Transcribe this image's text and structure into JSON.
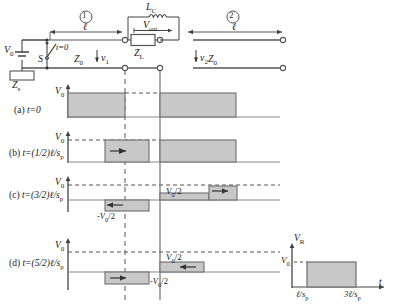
{
  "figure": {
    "type": "transmission-line-bounce-diagram",
    "circuit": {
      "source_label": "V",
      "source_sub": "0",
      "switch_label": "S",
      "switch_time_label": "t=0",
      "source_impedance": "Z",
      "source_impedance_sub": "s",
      "line1_marker": "①",
      "line2_marker": "②",
      "length_label_1": "ℓ",
      "length_label_2": "ℓ",
      "z0_left": "Z",
      "z0_left_sub": "0",
      "z0_right": "Z",
      "z0_right_sub": "0",
      "v1_label": "v",
      "v1_sub": "1",
      "v2_label": "v",
      "v2_sub": "2",
      "load_label": "Z",
      "load_sub": "L",
      "inductor_label": "L",
      "inductor_sub": "C",
      "vout_label": "V",
      "vout_sub": "out"
    },
    "panels": [
      {
        "id": "a",
        "label_prefix": "(a)",
        "time_label": "t=0",
        "y_axis_label": "V",
        "y_axis_sub": "0",
        "inline_labels": []
      },
      {
        "id": "b",
        "label_prefix": "(b)",
        "time_label": "t=(1/2)ℓ/s",
        "time_sub": "p",
        "y_axis_label": "V",
        "y_axis_sub": "0",
        "inline_labels": []
      },
      {
        "id": "c",
        "label_prefix": "(c)",
        "time_label": "t=(3/2)ℓ/s",
        "time_sub": "p",
        "y_axis_label": "V",
        "y_axis_sub": "0",
        "inline_labels": [
          {
            "text": "-V",
            "sub": "0",
            "suffix": "/2"
          },
          {
            "text": "V",
            "sub": "0",
            "suffix": "/2"
          }
        ]
      },
      {
        "id": "d",
        "label_prefix": "(d)",
        "time_label": "t=(5/2)ℓ/s",
        "time_sub": "p",
        "y_axis_label": "V",
        "y_axis_sub": "0",
        "inline_labels": [
          {
            "text": "-V",
            "sub": "0",
            "suffix": "/2"
          },
          {
            "text": "V",
            "sub": "0",
            "suffix": "/2"
          }
        ]
      }
    ],
    "inset": {
      "y_axis_label": "V",
      "y_axis_sub": "R",
      "x_axis_label": "t",
      "level_label": "V",
      "level_sub": "0",
      "tick_start": "ℓ/s",
      "tick_start_sub": "p",
      "tick_end": "3ℓ/s",
      "tick_end_sub": "p"
    },
    "colors": {
      "fill": "#c8c8c8",
      "stroke": "#4d4d4d",
      "line": "#808080",
      "text": "#1a1a1a"
    }
  }
}
